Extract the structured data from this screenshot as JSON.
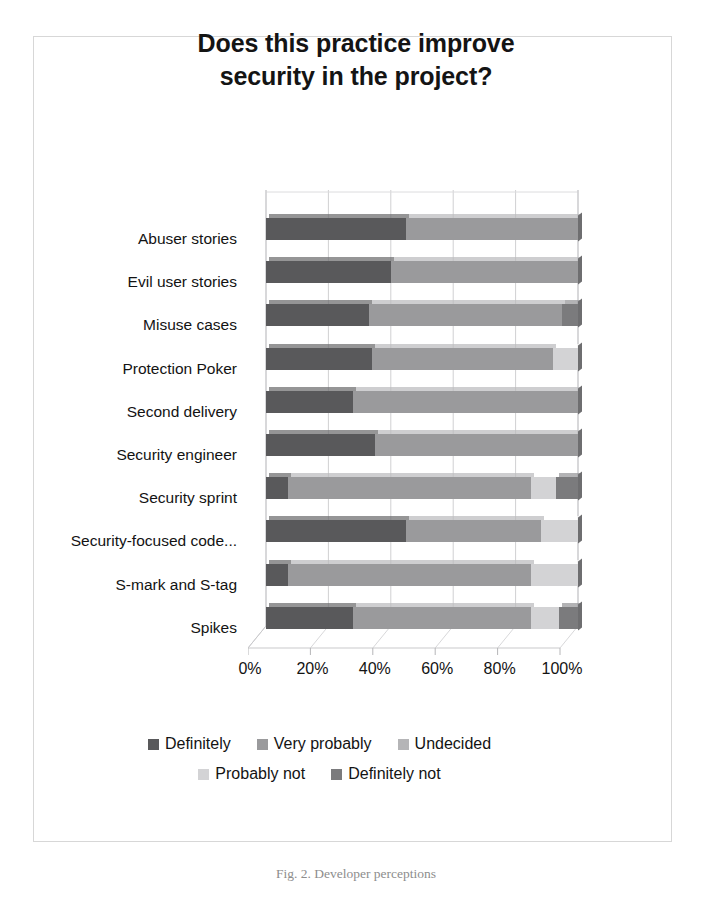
{
  "figure": {
    "caption": "Fig. 2.  Developer perceptions",
    "border_color": "#d7d7d7"
  },
  "chart_data": {
    "type": "bar",
    "subtype": "stacked-horizontal-100-3d",
    "title": "Does this practice improve security in the project?",
    "title_line1": "Does this practice improve",
    "title_line2": "security in the project?",
    "xlabel": "",
    "ylabel": "",
    "xlim": [
      0,
      100
    ],
    "xticks": [
      0,
      20,
      40,
      60,
      80,
      100
    ],
    "xtick_labels": [
      "0%",
      "20%",
      "40%",
      "60%",
      "80%",
      "100%"
    ],
    "grid": true,
    "legend_position": "bottom",
    "stacked_percent": true,
    "categories": [
      "Abuser stories",
      "Evil user stories",
      "Misuse cases",
      "Protection Poker",
      "Second delivery",
      "Security engineer",
      "Security sprint",
      "Security-focused code...",
      "S-mark and S-tag",
      "Spikes"
    ],
    "series": [
      {
        "name": "Definitely",
        "color": "#59595b",
        "values": [
          45,
          40,
          33,
          34,
          28,
          35,
          7,
          45,
          7,
          28
        ]
      },
      {
        "name": "Very probably",
        "color": "#9a9a9c",
        "values": [
          55,
          60,
          62,
          58,
          72,
          65,
          78,
          43,
          78,
          57
        ]
      },
      {
        "name": "Undecided",
        "color": "#b5b5b7",
        "values": [
          0,
          0,
          0,
          0,
          0,
          0,
          0,
          0,
          0,
          0
        ]
      },
      {
        "name": "Probably not",
        "color": "#d3d3d5",
        "values": [
          0,
          0,
          0,
          8,
          0,
          0,
          8,
          12,
          15,
          9
        ]
      },
      {
        "name": "Definitely not",
        "color": "#7b7b7d",
        "values": [
          0,
          0,
          5,
          0,
          0,
          0,
          7,
          0,
          0,
          6
        ]
      }
    ]
  }
}
